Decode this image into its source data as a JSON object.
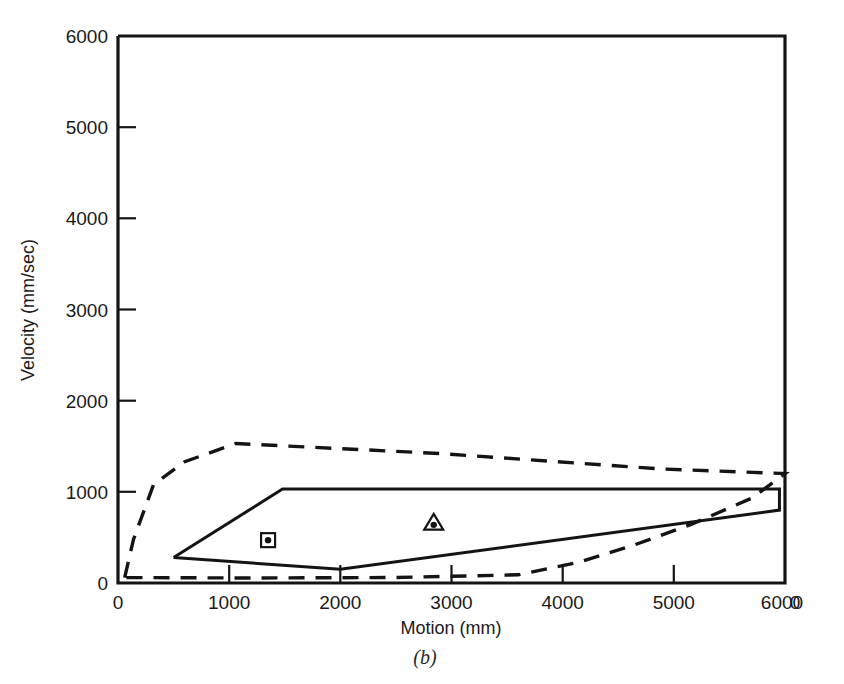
{
  "chart_data": {
    "type": "line",
    "title": "",
    "caption": "(b)",
    "xlabel": "Motion (mm)",
    "ylabel": "Velocity (mm/sec)",
    "xlim": [
      0,
      6000
    ],
    "ylim": [
      0,
      6000
    ],
    "xticks": [
      0,
      1000,
      2000,
      3000,
      4000,
      5000,
      6000
    ],
    "yticks": [
      0,
      1000,
      2000,
      3000,
      4000,
      5000,
      6000
    ],
    "xtick_labels": [
      "0",
      "1000",
      "2000",
      "3000",
      "4000",
      "5000",
      "6000"
    ],
    "ytick_labels": [
      "0",
      "1000",
      "2000",
      "3000",
      "4000",
      "5000",
      "6000"
    ],
    "grid": false,
    "legend": "none",
    "series": [
      {
        "name": "solid-envelope",
        "style": "solid",
        "closed": true,
        "points": [
          [
            500,
            280
          ],
          [
            1480,
            1030
          ],
          [
            5950,
            1030
          ],
          [
            5950,
            800
          ],
          [
            2000,
            150
          ],
          [
            500,
            280
          ]
        ]
      },
      {
        "name": "dashed-envelope",
        "style": "dashed",
        "closed": true,
        "points": [
          [
            60,
            60
          ],
          [
            140,
            480
          ],
          [
            320,
            1080
          ],
          [
            600,
            1330
          ],
          [
            1060,
            1530
          ],
          [
            2900,
            1420
          ],
          [
            4900,
            1250
          ],
          [
            6000,
            1200
          ],
          [
            5700,
            930
          ],
          [
            5150,
            640
          ],
          [
            4650,
            420
          ],
          [
            4150,
            230
          ],
          [
            3600,
            90
          ],
          [
            2500,
            60
          ],
          [
            1200,
            55
          ],
          [
            60,
            60
          ]
        ]
      }
    ],
    "markers": [
      {
        "name": "square-dot-marker",
        "shape": "square-with-dot",
        "x": 1350,
        "y": 470
      },
      {
        "name": "triangle-dot-marker",
        "shape": "triangle-with-dot",
        "x": 2840,
        "y": 660
      }
    ]
  }
}
